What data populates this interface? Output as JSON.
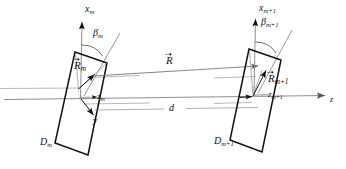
{
  "figure": {
    "type": "geometry-diagram",
    "background_color": "#ffffff",
    "line_color": "#1a1a1a",
    "axis_color": "#8a8a8a"
  },
  "axes": {
    "main_axis_label": "z",
    "left_plane": {
      "vertical_axis_label": "x",
      "vertical_axis_sub": "m",
      "local_axis_label": "z",
      "local_axis_sub": "m",
      "depth_axis_label": "y",
      "angle_label": "β",
      "angle_sub": "m",
      "plane_label": "D",
      "plane_sub": "m",
      "vector_label": "R",
      "vector_sub": "m"
    },
    "right_plane": {
      "vertical_axis_label": "x",
      "vertical_axis_sub": "m+1",
      "local_axis_label": "z",
      "local_axis_sub": "m+1",
      "angle_label": "β",
      "angle_sub": "m+1",
      "plane_label": "D",
      "plane_sub": "m+1",
      "vector_label": "R",
      "vector_sub": "m+1"
    }
  },
  "vectors": {
    "separation_vector_label": "R",
    "distance_label": "d"
  }
}
